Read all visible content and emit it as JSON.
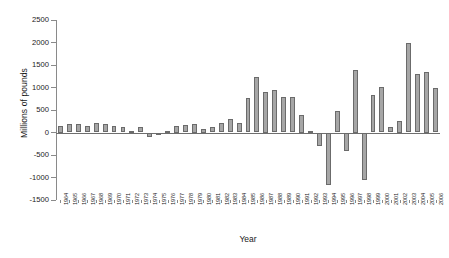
{
  "chart_data": {
    "type": "bar",
    "title": "",
    "xlabel": "Year",
    "ylabel": "Millions of pounds",
    "ylim": [
      -1500,
      2500
    ],
    "yticks": [
      2500,
      2000,
      1500,
      1000,
      500,
      0,
      -500,
      -1000,
      -1500
    ],
    "ytick_labels": [
      "2500",
      "2000",
      "1500",
      "1000",
      "500",
      "0",
      "-500",
      "-1000",
      "-1500"
    ],
    "grid": false,
    "legend": null,
    "bar_color": "#a6a6a6",
    "bar_edge_color": "#6b6b6b",
    "categories": [
      "1964",
      "1965",
      "1966",
      "1967",
      "1968",
      "1969",
      "1970",
      "1971",
      "1972",
      "1973",
      "1974",
      "1975",
      "1976",
      "1977",
      "1978",
      "1979",
      "1980",
      "1981",
      "1982",
      "1983",
      "1984",
      "1985",
      "1986",
      "1987",
      "1988",
      "1989",
      "1990",
      "1991",
      "1992",
      "1993",
      "1994",
      "1995",
      "1996",
      "1997",
      "1998",
      "1999",
      "2000",
      "2001",
      "2002",
      "2003",
      "2004",
      "2005",
      "2006"
    ],
    "values": [
      150,
      195,
      190,
      140,
      210,
      185,
      140,
      120,
      40,
      130,
      -110,
      -30,
      30,
      150,
      160,
      200,
      75,
      120,
      210,
      290,
      215,
      760,
      1230,
      900,
      955,
      780,
      780,
      400,
      30,
      -310,
      -1160,
      480,
      -420,
      1400,
      -1060,
      840,
      1020,
      130,
      250,
      1990,
      1290,
      1350,
      990
    ]
  }
}
